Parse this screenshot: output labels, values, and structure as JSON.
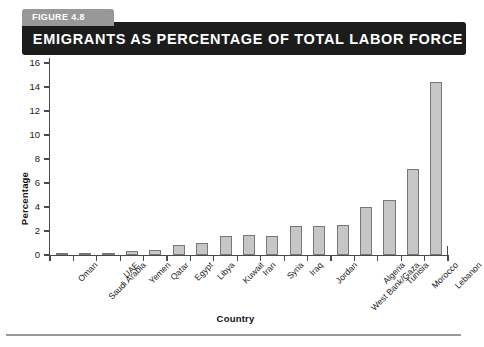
{
  "figure": {
    "tab_label": "FIGURE 4.8",
    "title": "EMIGRANTS AS PERCENTAGE OF TOTAL LABOR FORCE"
  },
  "colors": {
    "banner_background": "#1c1c1c",
    "tab_background": "#989898",
    "banner_text": "#ffffff",
    "bar_fill": "#c6c6c6",
    "bar_border": "#777777",
    "axis": "#4a4a4a"
  },
  "chart_data": {
    "type": "bar",
    "title": "EMIGRANTS AS PERCENTAGE OF TOTAL LABOR FORCE",
    "xlabel": "Country",
    "ylabel": "Percentage",
    "ylim": [
      0,
      16
    ],
    "yticks": [
      0,
      2,
      4,
      6,
      8,
      10,
      12,
      14,
      16
    ],
    "grid": false,
    "legend": false,
    "categories": [
      "Oman",
      "Saudi Arabia",
      "UAE",
      "Yemen",
      "Qatar",
      "Egypt",
      "Libya",
      "Kuwait",
      "Iran",
      "Syria",
      "Iraq",
      "Jordan",
      "West Bank/Gaza",
      "Algeria",
      "Tunisia",
      "Morocco",
      "Lebanon"
    ],
    "values": [
      0.1,
      0.2,
      0.2,
      0.35,
      0.45,
      0.8,
      1.0,
      1.6,
      1.7,
      1.6,
      2.4,
      2.45,
      2.5,
      4.0,
      4.6,
      7.2,
      14.4
    ]
  }
}
